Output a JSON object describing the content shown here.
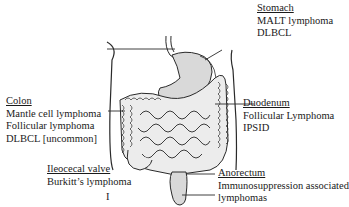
{
  "diagram": {
    "labels": {
      "stomach": {
        "title": "Stomach",
        "lines": [
          "MALT lymphoma",
          "DLBCL"
        ]
      },
      "colon": {
        "title": "Colon",
        "lines": [
          "Mantle cell lymphoma",
          "Follicular lymphoma",
          "DLBCL [uncommon]"
        ]
      },
      "duodenum": {
        "title": "Duodenum",
        "lines": [
          "Follicular Lymphoma",
          "IPSID"
        ]
      },
      "ileocecal": {
        "title": "Ileocecal valve",
        "lines": [
          "Burkitt’s lymphoma"
        ]
      },
      "anorectum": {
        "title": "Anorectum",
        "lines": [
          "Immunosuppression associated",
          "lymphomas"
        ]
      }
    },
    "footer_mark": "I",
    "colors": {
      "line": "#2a2a2a",
      "organ_fill": "#d9d9d9",
      "bowel_fill": "#e6e6e6"
    }
  }
}
